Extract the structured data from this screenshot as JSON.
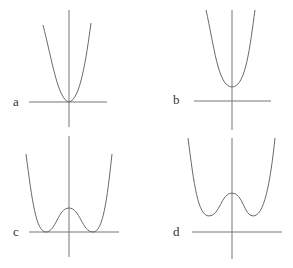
{
  "panels": [
    {
      "label": "a",
      "description": "quartic-like well with minimum on axis"
    },
    {
      "label": "b",
      "description": "parabola-like well with minimum above axis"
    },
    {
      "label": "c",
      "description": "double well with minima on axis"
    },
    {
      "label": "d",
      "description": "double well with minima above axis"
    }
  ],
  "colors": {
    "curve": "#6a6a6a",
    "axis": "#777777",
    "label": "#333333"
  }
}
